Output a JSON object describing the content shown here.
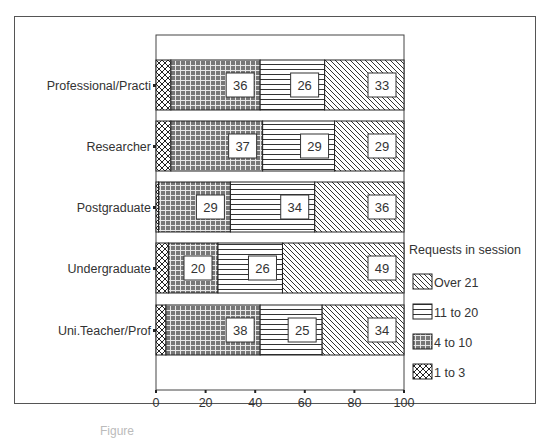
{
  "chart_data": {
    "type": "bar",
    "orientation": "horizontal",
    "stacked": true,
    "title": "",
    "xlabel": "",
    "ylabel": "",
    "xlim": [
      0,
      100
    ],
    "x_ticks": [
      "0",
      "20",
      "40",
      "60",
      "80",
      "100"
    ],
    "categories": [
      "Professional/Practi",
      "Researcher",
      "Postgraduate",
      "Undergraduate",
      "Uni.Teacher/Prof"
    ],
    "legend_title": "Requests in session",
    "legend_position": "right",
    "series": [
      {
        "name": "1 to 3",
        "pattern": "crosshatch",
        "values": [
          6,
          6,
          1,
          5,
          4
        ]
      },
      {
        "name": "4 to 10",
        "pattern": "grid-dark",
        "values": [
          36,
          37,
          29,
          20,
          38
        ]
      },
      {
        "name": "11 to 20",
        "pattern": "horizontal-lines",
        "values": [
          26,
          29,
          34,
          26,
          25
        ]
      },
      {
        "name": "Over 21",
        "pattern": "diagonal-lines",
        "values": [
          33,
          29,
          36,
          49,
          34
        ]
      }
    ],
    "data_labels_shown_for": [
      "4 to 10",
      "11 to 20",
      "Over 21"
    ],
    "grid": false
  },
  "legend": {
    "title": "Requests in session",
    "items": [
      "Over 21",
      "11 to 20",
      "4 to 10",
      "1 to 3"
    ]
  },
  "axis": {
    "ticks": [
      "0",
      "20",
      "40",
      "60",
      "80",
      "100"
    ]
  },
  "caption": "Figure"
}
